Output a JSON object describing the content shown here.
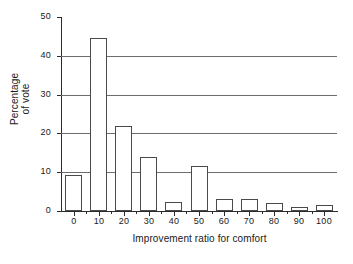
{
  "chart_data": {
    "type": "bar",
    "title": "",
    "subtitle": "",
    "xlabel": "Improvement ratio for comfort",
    "ylabel_line1": "Percentage",
    "ylabel_line2": "of vote",
    "ylabel": "Percentage of vote",
    "categories": [
      "0",
      "10",
      "20",
      "30",
      "40",
      "50",
      "60",
      "70",
      "80",
      "90",
      "100"
    ],
    "values": [
      9.2,
      44.5,
      22,
      14,
      2.2,
      11.5,
      3,
      3,
      2,
      1,
      1.5
    ],
    "series": [
      {
        "name": "Percentage of vote",
        "values": [
          9.2,
          44.5,
          22,
          14,
          2.2,
          11.5,
          3,
          3,
          2,
          1,
          1.5
        ]
      }
    ],
    "xlim": [
      -5,
      105
    ],
    "ylim": [
      0,
      50
    ],
    "ytick_values": [
      "0",
      "10",
      "20",
      "30",
      "40",
      "50"
    ],
    "xtick_values": [
      "0",
      "10",
      "20",
      "30",
      "40",
      "50",
      "60",
      "70",
      "80",
      "90",
      "100"
    ],
    "xminor_tick_values": [
      "5",
      "15",
      "25",
      "35",
      "45",
      "55",
      "65",
      "75",
      "85",
      "95"
    ],
    "grid": "horizontal",
    "gridline_values": [
      "10",
      "20",
      "30",
      "40"
    ],
    "legend": "none",
    "bar_fill": "#ffffff",
    "bar_stroke": "#4a4a4a",
    "gridline_color": "#6e6e6e",
    "axis_color": "#2b2b2b",
    "background": "#ffffff",
    "text_color": "#1a1a1a"
  }
}
